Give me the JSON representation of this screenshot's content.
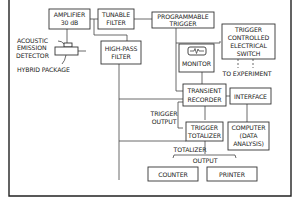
{
  "diagram": {
    "type": "block-diagram",
    "blocks": {
      "amplifier": {
        "line1": "AMPLIFIER",
        "line2": "30 dB"
      },
      "tunable_filter": {
        "line1": "TUNABLE",
        "line2": "FILTER"
      },
      "programmable_trigger": {
        "line1": "PROGRAMMABLE",
        "line2": "TRIGGER"
      },
      "trigger_switch": {
        "line1": "TRIGGER",
        "line2": "CONTROLLED",
        "line3": "ELECTRICAL",
        "line4": "SWITCH"
      },
      "high_pass_filter": {
        "line1": "HIGH-PASS",
        "line2": "FILTER"
      },
      "monitor": {
        "label": "MONITOR",
        "screen_glyph": "-∿-"
      },
      "transient_recorder": {
        "line1": "TRANSIENT",
        "line2": "RECORDER"
      },
      "interface": {
        "label": "INTERFACE"
      },
      "trigger_totalizer": {
        "line1": "TRIGGER",
        "line2": "TOTALIZER"
      },
      "computer": {
        "line1": "COMPUTER",
        "line2": "(DATA",
        "line3": "ANALYSIS)"
      },
      "counter": {
        "label": "COUNTER"
      },
      "printer": {
        "label": "PRINTER"
      }
    },
    "labels": {
      "acoustic_emission": {
        "line1": "ACOUSTIC",
        "line2": "EMISSION"
      },
      "detector": "DETECTOR",
      "hybrid_package": "HYBRID PACKAGE",
      "to_experiment": "TO EXPERIMENT",
      "trigger_output": {
        "line1": "TRIGGER",
        "line2": "OUTPUT"
      },
      "totalizer_output": {
        "line1": "TOTALIZER",
        "line2": "OUTPUT"
      }
    },
    "colors": {
      "line": "#444444",
      "background": "#ffffff"
    }
  }
}
